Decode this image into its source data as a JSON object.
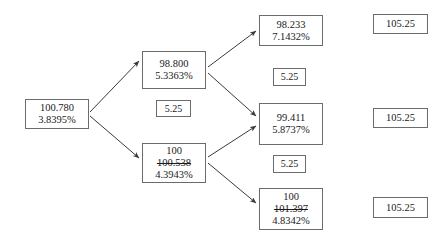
{
  "diagram": {
    "type": "binomial-interest-rate-tree",
    "background_color": "#ffffff",
    "border_color": "#6b6b6b",
    "text_color": "#1a1a1a",
    "nodes": [
      {
        "id": "root",
        "name": "node-root",
        "kind": "value-node",
        "lines": [
          "100.780",
          "3.8395%"
        ],
        "price": "100.780",
        "rate": "3.8395%",
        "x": 25,
        "y": 99,
        "w": 64,
        "h": 30
      },
      {
        "id": "up",
        "name": "node-up",
        "kind": "value-node",
        "lines": [
          "98.800",
          "5.3363%"
        ],
        "price": "98.800",
        "rate": "5.3363%",
        "x": 142,
        "y": 51,
        "w": 64,
        "h": 38
      },
      {
        "id": "down",
        "name": "node-down",
        "kind": "value-node-struck",
        "lines": [
          "100",
          "100.538",
          "4.3943%"
        ],
        "price_final": "100",
        "price_struck": "100.538",
        "rate": "4.3943%",
        "x": 142,
        "y": 143,
        "w": 64,
        "h": 40
      },
      {
        "id": "up-up",
        "name": "node-up-up",
        "kind": "value-node",
        "lines": [
          "98.233",
          "7.1432%"
        ],
        "price": "98.233",
        "rate": "7.1432%",
        "x": 259,
        "y": 15,
        "w": 64,
        "h": 31
      },
      {
        "id": "mid",
        "name": "node-middle",
        "kind": "value-node",
        "lines": [
          "99.411",
          "5.8737%"
        ],
        "price": "99.411",
        "rate": "5.8737%",
        "x": 259,
        "y": 103,
        "w": 64,
        "h": 42
      },
      {
        "id": "down-down",
        "name": "node-down-down",
        "kind": "value-node-struck",
        "lines": [
          "100",
          "101.397",
          "4.8342%"
        ],
        "price_final": "100",
        "price_struck": "101.397",
        "rate": "4.8342%",
        "x": 259,
        "y": 188,
        "w": 64,
        "h": 42
      }
    ],
    "coupons": [
      {
        "id": "coupon-mid-left",
        "name": "coupon-box-left",
        "value": "5.25",
        "x": 156,
        "y": 100,
        "w": 35,
        "h": 17
      },
      {
        "id": "coupon-top-right",
        "name": "coupon-box-upper-right",
        "value": "5.25",
        "x": 273,
        "y": 68,
        "w": 33,
        "h": 18
      },
      {
        "id": "coupon-bottom-right",
        "name": "coupon-box-lower-right",
        "value": "5.25",
        "x": 273,
        "y": 155,
        "w": 33,
        "h": 18
      }
    ],
    "redemptions": [
      {
        "id": "redemption-top",
        "name": "redemption-box-top",
        "value": "105.25",
        "x": 373,
        "y": 14,
        "w": 55,
        "h": 20
      },
      {
        "id": "redemption-middle",
        "name": "redemption-box-middle",
        "value": "105.25",
        "x": 373,
        "y": 108,
        "w": 55,
        "h": 20
      },
      {
        "id": "redemption-bottom",
        "name": "redemption-box-bottom",
        "value": "105.25",
        "x": 373,
        "y": 197,
        "w": 55,
        "h": 21
      }
    ],
    "edges": [
      {
        "name": "edge-root-to-up",
        "from": "root",
        "to": "up",
        "x1": 90,
        "y1": 112,
        "x2": 139,
        "y2": 61
      },
      {
        "name": "edge-root-to-down",
        "from": "root",
        "to": "down",
        "x1": 90,
        "y1": 116,
        "x2": 139,
        "y2": 158
      },
      {
        "name": "edge-up-to-upup",
        "from": "up",
        "to": "up-up",
        "x1": 208,
        "y1": 67,
        "x2": 256,
        "y2": 31
      },
      {
        "name": "edge-up-to-mid",
        "from": "up",
        "to": "mid",
        "x1": 208,
        "y1": 73,
        "x2": 256,
        "y2": 116
      },
      {
        "name": "edge-down-to-mid",
        "from": "down",
        "to": "mid",
        "x1": 208,
        "y1": 157,
        "x2": 256,
        "y2": 126
      },
      {
        "name": "edge-down-to-downdown",
        "from": "down",
        "to": "down-down",
        "x1": 208,
        "y1": 163,
        "x2": 256,
        "y2": 203
      }
    ]
  }
}
